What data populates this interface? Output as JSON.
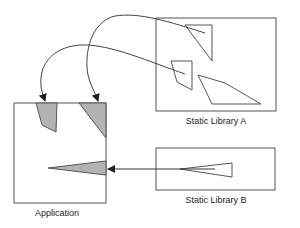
{
  "diagram": {
    "nodes": [
      {
        "id": "application",
        "label": "Application"
      },
      {
        "id": "static-library-a",
        "label": "Static Library A"
      },
      {
        "id": "static-library-b",
        "label": "Static Library B"
      }
    ],
    "edges": [
      {
        "from": "static-library-a",
        "to": "application",
        "note": "triangle module copied into application"
      },
      {
        "from": "static-library-a",
        "to": "application",
        "note": "quad module copied into application"
      },
      {
        "from": "static-library-b",
        "to": "application",
        "note": "wedge module copied into application"
      }
    ]
  },
  "colors": {
    "stroke": "#555555",
    "fill_linked": "#b3b3b3",
    "arrow": "#222222"
  }
}
